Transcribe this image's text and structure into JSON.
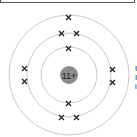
{
  "diagram": {
    "nucleus": {
      "label": "11+",
      "color": "#8a8a8a"
    },
    "shells": [
      {
        "name": "shell-1",
        "electrons": 2
      },
      {
        "name": "shell-2",
        "electrons": 8
      },
      {
        "name": "shell-3",
        "electrons": 1
      }
    ],
    "electron_symbol": "×",
    "ring_color": "#c8c8c8",
    "side_text": [
      "I",
      "I",
      "i"
    ]
  }
}
